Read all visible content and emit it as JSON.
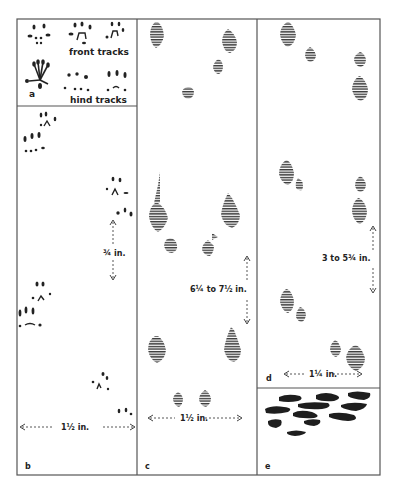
{
  "figure": {
    "colors": {
      "ink": "#222222",
      "hatch": "#444444",
      "frame": "#555555",
      "background": "#ffffff"
    },
    "panels": [
      {
        "id": "a",
        "label": "a",
        "captions": [
          "front tracks",
          "hind tracks"
        ]
      },
      {
        "id": "b",
        "label": "b",
        "measurements": [
          "¾ in.",
          "1½ in."
        ]
      },
      {
        "id": "c",
        "label": "c",
        "measurements": [
          "6¼ to 7½ in.",
          "1½ in."
        ]
      },
      {
        "id": "d",
        "label": "d",
        "measurements": [
          "3 to 5¾ in.",
          "1¼ in."
        ]
      },
      {
        "id": "e",
        "label": "e",
        "description": "scat / droppings"
      }
    ]
  }
}
